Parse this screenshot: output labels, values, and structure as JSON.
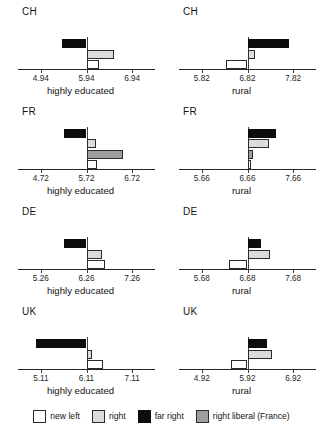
{
  "chart_data": {
    "type": "bar",
    "title": "",
    "orientation": "horizontal",
    "layout": {
      "rows": 4,
      "columns": 2,
      "grid": false,
      "legend_position": "bottom"
    },
    "legend": [
      {
        "key": "newleft",
        "label": "new left",
        "color": "#ffffff"
      },
      {
        "key": "right",
        "label": "right",
        "color": "#dcdcdc"
      },
      {
        "key": "farright",
        "label": "far right",
        "color": "#0d0d0d"
      },
      {
        "key": "rightlib",
        "label": "right liberal (France)",
        "color": "#9e9e9e"
      }
    ],
    "panels": [
      {
        "country": "CH",
        "xlabel": "highly educated",
        "center": 5.94,
        "ticks": [
          4.94,
          5.94,
          6.94
        ],
        "tick_labels": [
          "4.94",
          "5.94",
          "6.94"
        ],
        "xlim": [
          4.44,
          7.44
        ],
        "bars": [
          {
            "key": "farright",
            "label": "far right",
            "value": -0.53
          },
          {
            "key": "right",
            "label": "right",
            "value": 0.6
          },
          {
            "key": "newleft",
            "label": "new left",
            "value": 0.27
          }
        ]
      },
      {
        "country": "CH",
        "xlabel": "rural",
        "center": 6.82,
        "ticks": [
          5.82,
          6.82,
          7.82
        ],
        "tick_labels": [
          "5.82",
          "6.82",
          "7.82"
        ],
        "xlim": [
          5.32,
          8.32
        ],
        "bars": [
          {
            "key": "farright",
            "label": "far right",
            "value": 0.9
          },
          {
            "key": "right",
            "label": "right",
            "value": 0.17
          },
          {
            "key": "newleft",
            "label": "new left",
            "value": -0.47
          }
        ]
      },
      {
        "country": "FR",
        "xlabel": "highly educated",
        "center": 5.72,
        "ticks": [
          4.72,
          5.72,
          6.72
        ],
        "tick_labels": [
          "4.72",
          "5.72",
          "6.72"
        ],
        "xlim": [
          4.22,
          7.22
        ],
        "bars": [
          {
            "key": "farright",
            "label": "far right",
            "value": -0.5
          },
          {
            "key": "right",
            "label": "right",
            "value": 0.2
          },
          {
            "key": "rightlib",
            "label": "right liberal (France)",
            "value": 0.8
          },
          {
            "key": "newleft",
            "label": "new left",
            "value": 0.23
          }
        ]
      },
      {
        "country": "FR",
        "xlabel": "rural",
        "center": 6.66,
        "ticks": [
          5.66,
          6.66,
          7.66
        ],
        "tick_labels": [
          "5.66",
          "6.66",
          "7.66"
        ],
        "xlim": [
          5.16,
          8.16
        ],
        "bars": [
          {
            "key": "farright",
            "label": "far right",
            "value": 0.63
          },
          {
            "key": "right",
            "label": "right",
            "value": 0.47
          },
          {
            "key": "rightlib",
            "label": "right liberal (France)",
            "value": 0.13
          },
          {
            "key": "newleft",
            "label": "new left",
            "value": 0.07
          }
        ]
      },
      {
        "country": "DE",
        "xlabel": "highly educated",
        "center": 6.26,
        "ticks": [
          5.26,
          6.26,
          7.26
        ],
        "tick_labels": [
          "5.26",
          "6.26",
          "7.26"
        ],
        "xlim": [
          4.76,
          7.76
        ],
        "bars": [
          {
            "key": "farright",
            "label": "far right",
            "value": -0.5
          },
          {
            "key": "right",
            "label": "right",
            "value": 0.33
          },
          {
            "key": "newleft",
            "label": "new left",
            "value": 0.4
          }
        ]
      },
      {
        "country": "DE",
        "xlabel": "rural",
        "center": 6.68,
        "ticks": [
          5.68,
          6.68,
          7.68
        ],
        "tick_labels": [
          "5.68",
          "6.68",
          "7.68"
        ],
        "xlim": [
          5.18,
          8.18
        ],
        "bars": [
          {
            "key": "farright",
            "label": "far right",
            "value": 0.3
          },
          {
            "key": "right",
            "label": "right",
            "value": 0.5
          },
          {
            "key": "newleft",
            "label": "new left",
            "value": -0.4
          }
        ]
      },
      {
        "country": "UK",
        "xlabel": "highly educated",
        "center": 6.11,
        "ticks": [
          5.11,
          6.11,
          7.11
        ],
        "tick_labels": [
          "5.11",
          "6.11",
          "7.11"
        ],
        "xlim": [
          4.61,
          7.61
        ],
        "bars": [
          {
            "key": "farright",
            "label": "far right",
            "value": -1.1
          },
          {
            "key": "right",
            "label": "right",
            "value": 0.13
          },
          {
            "key": "newleft",
            "label": "new left",
            "value": 0.37
          }
        ]
      },
      {
        "country": "UK",
        "xlabel": "rural",
        "center": 5.92,
        "ticks": [
          4.92,
          5.92,
          6.92
        ],
        "tick_labels": [
          "4.92",
          "5.92",
          "6.92"
        ],
        "xlim": [
          4.42,
          7.42
        ],
        "bars": [
          {
            "key": "farright",
            "label": "far right",
            "value": 0.43
          },
          {
            "key": "right",
            "label": "right",
            "value": 0.53
          },
          {
            "key": "newleft",
            "label": "new left",
            "value": -0.37
          }
        ]
      }
    ]
  }
}
